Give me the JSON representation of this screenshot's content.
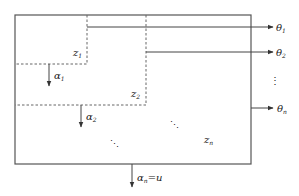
{
  "diagram": {
    "colors": {
      "line": "#555555",
      "dashed": "#666666",
      "text": "#222222"
    },
    "regions": [
      {
        "id": "z1",
        "label": "z",
        "sub": "1"
      },
      {
        "id": "z2",
        "label": "z",
        "sub": "2"
      },
      {
        "id": "zn",
        "label": "z",
        "sub": "n"
      }
    ],
    "outputs": [
      {
        "label": "θ",
        "sub": "1"
      },
      {
        "label": "θ",
        "sub": "2"
      },
      {
        "label": "θ",
        "sub": "n"
      }
    ],
    "outputs_ellipsis": "⋮",
    "inner_arrows": [
      {
        "label": "α",
        "sub": "1"
      },
      {
        "label": "α",
        "sub": "2"
      }
    ],
    "diagonal_ellipsis": "⋱",
    "bottom_arrow": {
      "label": "α",
      "sub": "n",
      "suffix": "=u"
    }
  }
}
